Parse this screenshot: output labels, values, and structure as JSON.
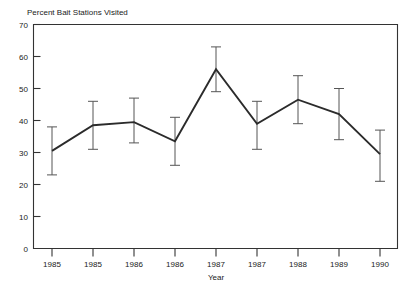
{
  "chart_data": {
    "type": "line",
    "title": "Percent Bait Stations Visited",
    "xlabel": "Year",
    "ylabel": "",
    "categories": [
      "1985",
      "1985",
      "1986",
      "1986",
      "1987",
      "1987",
      "1988",
      "1989",
      "1990"
    ],
    "values": [
      30.5,
      38.5,
      39.5,
      33.5,
      56.0,
      39.0,
      46.5,
      42.0,
      29.5
    ],
    "error_low": [
      23.0,
      31.0,
      33.0,
      26.0,
      49.0,
      31.0,
      39.0,
      34.0,
      21.0
    ],
    "error_high": [
      38.0,
      46.0,
      47.0,
      41.0,
      63.0,
      46.0,
      54.0,
      50.0,
      37.0
    ],
    "ylim": [
      0,
      70
    ],
    "yticks": [
      0,
      10,
      20,
      30,
      40,
      50,
      60,
      70
    ],
    "ytick_labels": [
      "0",
      "10",
      "20",
      "30",
      "40",
      "50",
      "60",
      "70"
    ],
    "grid": false,
    "legend": false,
    "error_bars": true,
    "line_color": "#2b2b2b",
    "errorbar_color": "#555555",
    "frame_color": "#333333",
    "background_color": "#ffffff"
  }
}
